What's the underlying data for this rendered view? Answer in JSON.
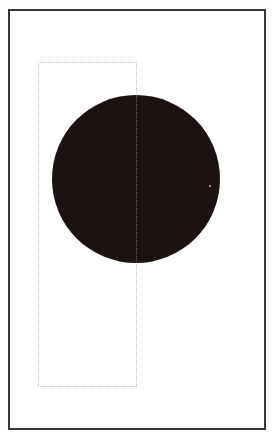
{
  "diagram": {
    "type": "composition-layout",
    "description": "Framed page with a solid black circle overlapping a dotted guide rectangle",
    "frame": {
      "x": 8,
      "y": 9,
      "width": 256,
      "height": 419,
      "stroke_color": "#3a3636"
    },
    "guide_rectangle": {
      "x": 38,
      "y": 62,
      "width": 98,
      "height": 324,
      "stroke_style": "dotted",
      "stroke_color": "#b9b5b5"
    },
    "circle": {
      "center_x": 136,
      "center_y": 179,
      "diameter": 168,
      "fill_color": "#1c1212"
    },
    "colors": {
      "background": "#ffffff",
      "frame": "#3a3636",
      "circle": "#1c1212",
      "guide": "#b9b5b5"
    }
  }
}
